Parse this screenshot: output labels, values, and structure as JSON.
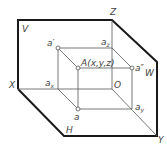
{
  "diagram": {
    "colors": {
      "frame": "#1a1a1a",
      "thin": "#555555",
      "text": "#444444",
      "background": "#ffffff"
    },
    "planes": {
      "V": "V",
      "W": "W",
      "H": "H"
    },
    "axes": {
      "X": "X",
      "Y": "Y",
      "Z": "Z",
      "origin": "O"
    },
    "points": {
      "A": "A(x,y,z)",
      "a": "a",
      "a_prime": "a′",
      "a_double_prime": "a″",
      "ax_base": "a",
      "ax_sub": "x",
      "ay_base": "a",
      "ay_sub": "y",
      "az_base": "a",
      "az_sub": "z"
    }
  }
}
